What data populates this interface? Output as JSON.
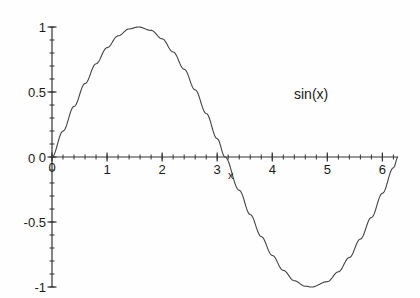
{
  "chart_data": {
    "type": "line",
    "title": "",
    "xlabel": "x",
    "ylabel": "",
    "series_label": "sin(x)",
    "legend_position": "inside-upper-right",
    "grid": false,
    "xlim": [
      0,
      6.2832
    ],
    "ylim": [
      -1,
      1
    ],
    "x_ticks": [
      0,
      1,
      2,
      3,
      4,
      5,
      6
    ],
    "x_tick_labels": [
      "0",
      "1",
      "2",
      "3",
      "4",
      "5",
      "6"
    ],
    "x_minor_step": 0.2,
    "y_ticks": [
      -1,
      -0.5,
      0,
      0.5,
      1
    ],
    "y_tick_labels": [
      "-1",
      "-0.5",
      "0",
      "0.5",
      "1"
    ],
    "y_minor_step": 0.1,
    "function": "sin(x)",
    "points": [
      {
        "x": 0.0,
        "y": 0.0
      },
      {
        "x": 0.2,
        "y": 0.199
      },
      {
        "x": 0.4,
        "y": 0.389
      },
      {
        "x": 0.6,
        "y": 0.565
      },
      {
        "x": 0.8,
        "y": 0.717
      },
      {
        "x": 1.0,
        "y": 0.841
      },
      {
        "x": 1.2,
        "y": 0.932
      },
      {
        "x": 1.4,
        "y": 0.985
      },
      {
        "x": 1.5708,
        "y": 1.0
      },
      {
        "x": 1.8,
        "y": 0.974
      },
      {
        "x": 2.0,
        "y": 0.909
      },
      {
        "x": 2.2,
        "y": 0.808
      },
      {
        "x": 2.4,
        "y": 0.675
      },
      {
        "x": 2.6,
        "y": 0.516
      },
      {
        "x": 2.8,
        "y": 0.335
      },
      {
        "x": 3.0,
        "y": 0.141
      },
      {
        "x": 3.1416,
        "y": 0.0
      },
      {
        "x": 3.4,
        "y": -0.256
      },
      {
        "x": 3.6,
        "y": -0.443
      },
      {
        "x": 3.8,
        "y": -0.612
      },
      {
        "x": 4.0,
        "y": -0.757
      },
      {
        "x": 4.2,
        "y": -0.872
      },
      {
        "x": 4.4,
        "y": -0.952
      },
      {
        "x": 4.6,
        "y": -0.994
      },
      {
        "x": 4.7124,
        "y": -1.0
      },
      {
        "x": 5.0,
        "y": -0.959
      },
      {
        "x": 5.2,
        "y": -0.883
      },
      {
        "x": 5.4,
        "y": -0.773
      },
      {
        "x": 5.6,
        "y": -0.631
      },
      {
        "x": 5.8,
        "y": -0.465
      },
      {
        "x": 6.0,
        "y": -0.279
      },
      {
        "x": 6.2,
        "y": -0.083
      },
      {
        "x": 6.2832,
        "y": 0.0
      }
    ],
    "colors": {
      "background": "#fefefe",
      "axis": "#333333",
      "curve": "#444444",
      "text": "#1a1a1a"
    }
  },
  "labels": {
    "y": [
      {
        "value": 1,
        "text": "1"
      },
      {
        "value": 0.5,
        "text": "0.5"
      },
      {
        "value": 0,
        "text": "0"
      },
      {
        "value": -0.5,
        "text": "-0.5"
      },
      {
        "value": -1,
        "text": "-1"
      }
    ],
    "x": [
      {
        "value": 0,
        "text": "0"
      },
      {
        "value": 1,
        "text": "1"
      },
      {
        "value": 2,
        "text": "2"
      },
      {
        "value": 3,
        "text": "3"
      },
      {
        "value": 4,
        "text": "4"
      },
      {
        "value": 5,
        "text": "5"
      },
      {
        "value": 6,
        "text": "6"
      }
    ],
    "x_axis_name": "x",
    "origin_x": "0",
    "series": "sin(x)"
  }
}
